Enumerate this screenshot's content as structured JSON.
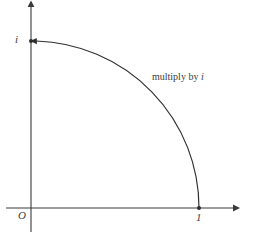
{
  "figure": {
    "type": "math-diagram",
    "background_color": "#ffffff",
    "stroke_color": "#3a3a3a",
    "width": 255,
    "height": 238
  },
  "axes": {
    "origin": {
      "x": 31,
      "y": 208
    },
    "x_axis": {
      "start_x": 6,
      "end_x": 237,
      "y": 208,
      "arrow": "right"
    },
    "y_axis": {
      "x": 31,
      "start_y": 232,
      "end_y": 2,
      "arrow": "up"
    },
    "origin_label": "O"
  },
  "points": [
    {
      "name": "point-one",
      "label": "1",
      "x": 199,
      "y": 208
    },
    {
      "name": "point-i",
      "label": "i",
      "x": 31,
      "y": 41
    }
  ],
  "arc": {
    "name": "rotation-arc",
    "radius": 168,
    "from": {
      "x": 199,
      "y": 208
    },
    "to": {
      "x": 31,
      "y": 41
    },
    "direction": "counterclockwise",
    "arrow_at": "end"
  },
  "annotation": {
    "prefix": "multiply by ",
    "variable": "i",
    "full_text": "multiply by i"
  }
}
